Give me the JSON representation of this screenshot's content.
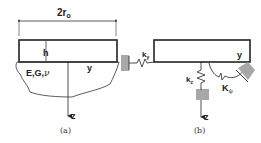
{
  "panel_a": {
    "dimension_label": "2r",
    "dimension_sub": "o",
    "height_label": "h",
    "material_label": "E,G,",
    "poisson_symbol": "ν",
    "y_axis_label": "y",
    "z_axis_label": "z",
    "caption": "(a)"
  },
  "panel_b": {
    "ky_label": "k",
    "ky_sub": "y",
    "kz_label": "k",
    "kz_sub": "z",
    "kpsi_label": "K",
    "kpsi_sub": "ψ",
    "y_axis_label": "y",
    "z_axis_label": "z",
    "caption": "(b)"
  },
  "colors": {
    "line": "#222222",
    "support_fill": "#a8a8a8"
  }
}
